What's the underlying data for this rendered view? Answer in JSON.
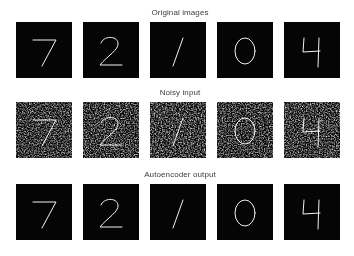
{
  "figure": {
    "background_color": "#ffffff",
    "tile_background_color": "#050505",
    "digit_color": "#f2f2f2",
    "title_color": "#3c3c3c",
    "grid": {
      "rows": 3,
      "columns": 5
    }
  },
  "rows": [
    {
      "title": "Original images",
      "name": "original-images",
      "style": "clean",
      "tiles": [
        {
          "digit": "7",
          "label": "digit-7"
        },
        {
          "digit": "2",
          "label": "digit-2"
        },
        {
          "digit": "1",
          "label": "digit-1"
        },
        {
          "digit": "0",
          "label": "digit-0"
        },
        {
          "digit": "4",
          "label": "digit-4"
        }
      ]
    },
    {
      "title": "Noisy input",
      "name": "noisy-input",
      "style": "noisy",
      "tiles": [
        {
          "digit": "7",
          "label": "digit-7"
        },
        {
          "digit": "2",
          "label": "digit-2"
        },
        {
          "digit": "1",
          "label": "digit-1"
        },
        {
          "digit": "0",
          "label": "digit-0"
        },
        {
          "digit": "4",
          "label": "digit-4"
        }
      ]
    },
    {
      "title": "Autoencoder output",
      "name": "autoencoder-output",
      "style": "recon",
      "tiles": [
        {
          "digit": "7",
          "label": "digit-7"
        },
        {
          "digit": "2",
          "label": "digit-2"
        },
        {
          "digit": "1",
          "label": "digit-1"
        },
        {
          "digit": "0",
          "label": "digit-0"
        },
        {
          "digit": "4",
          "label": "digit-4"
        }
      ]
    }
  ]
}
